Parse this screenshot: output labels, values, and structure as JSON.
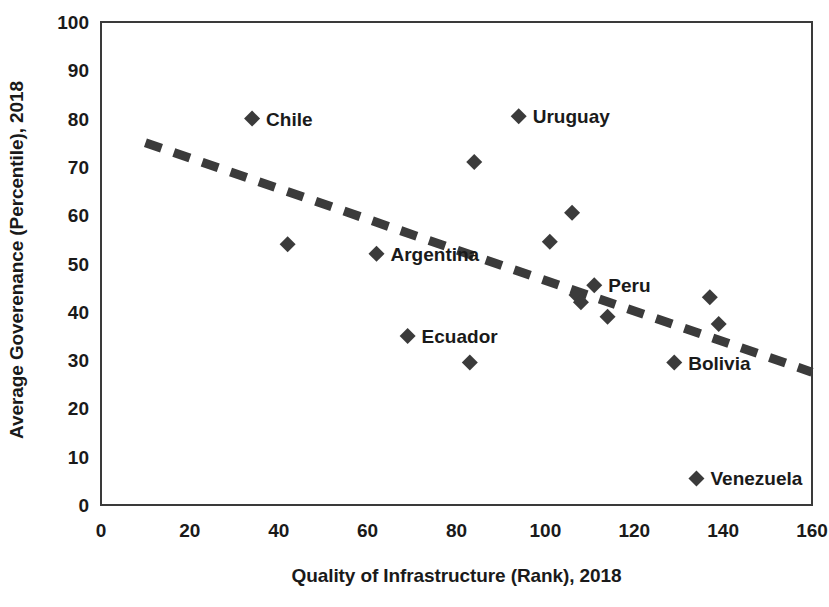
{
  "chart_data": {
    "type": "scatter",
    "title": "",
    "xlabel": "Quality of Infrastructure (Rank), 2018",
    "ylabel": "Average Goverenance (Percentile), 2018",
    "xlim": [
      0,
      160
    ],
    "ylim": [
      0,
      100
    ],
    "xticks": [
      "0",
      "20",
      "40",
      "60",
      "80",
      "100",
      "120",
      "140",
      "160"
    ],
    "yticks": [
      "0",
      "10",
      "20",
      "30",
      "40",
      "50",
      "60",
      "70",
      "80",
      "90",
      "100"
    ],
    "grid": false,
    "legend": "none",
    "marker_shape": "diamond",
    "marker_color": "#3b3b3b",
    "points": [
      {
        "label": "Chile",
        "x": 34,
        "y": 80.0,
        "label_side": "right"
      },
      {
        "label": "",
        "x": 42,
        "y": 54.0,
        "label_side": "none"
      },
      {
        "label": "Argentina",
        "x": 62,
        "y": 52.0,
        "label_side": "right"
      },
      {
        "label": "Ecuador",
        "x": 69,
        "y": 35.0,
        "label_side": "right"
      },
      {
        "label": "",
        "x": 83,
        "y": 29.5,
        "label_side": "none"
      },
      {
        "label": "",
        "x": 84,
        "y": 71.0,
        "label_side": "none"
      },
      {
        "label": "Uruguay",
        "x": 94,
        "y": 80.5,
        "label_side": "right"
      },
      {
        "label": "",
        "x": 101,
        "y": 54.5,
        "label_side": "none"
      },
      {
        "label": "",
        "x": 106,
        "y": 60.5,
        "label_side": "none"
      },
      {
        "label": "",
        "x": 107,
        "y": 43.5,
        "label_side": "none"
      },
      {
        "label": "",
        "x": 108,
        "y": 42.0,
        "label_side": "none"
      },
      {
        "label": "Peru",
        "x": 111,
        "y": 45.5,
        "label_side": "right"
      },
      {
        "label": "",
        "x": 114,
        "y": 39.0,
        "label_side": "none"
      },
      {
        "label": "Bolivia",
        "x": 129,
        "y": 29.5,
        "label_side": "right"
      },
      {
        "label": "Venezuela",
        "x": 134,
        "y": 5.5,
        "label_side": "right"
      },
      {
        "label": "",
        "x": 137,
        "y": 43.0,
        "label_side": "none"
      },
      {
        "label": "",
        "x": 139,
        "y": 37.5,
        "label_side": "none"
      }
    ],
    "trendline": {
      "style": "dashed",
      "color": "#3b3b3b",
      "x_start": 10,
      "y_start": 75.0,
      "x_end": 160,
      "y_end": 27.5
    }
  }
}
